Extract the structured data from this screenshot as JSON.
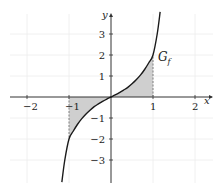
{
  "chart_data": {
    "type": "line",
    "title": "",
    "xlabel": "x",
    "ylabel": "y",
    "xlim": [
      -2.4,
      2.4
    ],
    "ylim": [
      -4.1,
      4.1
    ],
    "grid": true,
    "x_ticks": [
      -2,
      -1,
      1,
      2
    ],
    "x_tick_labels": [
      "−2",
      "−1",
      "1",
      "2"
    ],
    "y_ticks": [
      3,
      2,
      1,
      -1,
      -2,
      -3
    ],
    "y_tick_labels": [
      "3",
      "2",
      "1",
      "−1",
      "−2",
      "−3"
    ],
    "series": [
      {
        "name": "G_f",
        "label_main": "G",
        "label_sub": "f",
        "color": "#1a1a1a",
        "x": [
          -1.17,
          -1.1,
          -1.0,
          -0.9,
          -0.8,
          -0.7,
          -0.6,
          -0.5,
          -0.4,
          -0.3,
          -0.2,
          -0.1,
          0,
          0.1,
          0.2,
          0.3,
          0.4,
          0.5,
          0.6,
          0.7,
          0.8,
          0.9,
          1.0,
          1.1,
          1.17
        ],
        "y": [
          -4.05,
          -3.0,
          -2.0,
          -1.63,
          -1.31,
          -1.04,
          -0.82,
          -0.63,
          -0.46,
          -0.33,
          -0.21,
          -0.1,
          0,
          0.1,
          0.21,
          0.33,
          0.46,
          0.63,
          0.82,
          1.04,
          1.31,
          1.63,
          2.0,
          3.0,
          4.05
        ]
      }
    ],
    "shaded_regions": [
      {
        "from_x": -1,
        "to_x": 0,
        "between": "curve and x-axis",
        "color": "#cccccc"
      },
      {
        "from_x": 0,
        "to_x": 1,
        "between": "curve and x-axis",
        "color": "#cccccc"
      }
    ],
    "dashed_lines": [
      {
        "x": -1,
        "from_y": 0,
        "to_y": -2
      },
      {
        "x": 1,
        "from_y": 0,
        "to_y": 2
      }
    ]
  },
  "colors": {
    "axis": "#333333",
    "grid": "#ececec",
    "fill": "#cfcfcf",
    "curve": "#1a1a1a",
    "dash": "#777777"
  }
}
